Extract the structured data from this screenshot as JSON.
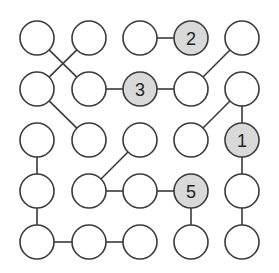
{
  "puzzle": {
    "type": "hashi-style node graph",
    "rows": 5,
    "cols": 5,
    "colors": {
      "background": "#ffffff",
      "node_fill": "#ffffff",
      "clue_fill": "#d9d9d9",
      "stroke": "#3a3a3a",
      "text": "#222222"
    },
    "col_x": [
      37,
      89,
      140,
      191,
      242
    ],
    "row_y": [
      38,
      89,
      140,
      191,
      242
    ],
    "radius": 17,
    "nodes": [
      {
        "r": 0,
        "c": 0,
        "label": ""
      },
      {
        "r": 0,
        "c": 1,
        "label": ""
      },
      {
        "r": 0,
        "c": 2,
        "label": ""
      },
      {
        "r": 0,
        "c": 3,
        "label": "2"
      },
      {
        "r": 0,
        "c": 4,
        "label": ""
      },
      {
        "r": 1,
        "c": 0,
        "label": ""
      },
      {
        "r": 1,
        "c": 1,
        "label": ""
      },
      {
        "r": 1,
        "c": 2,
        "label": "3"
      },
      {
        "r": 1,
        "c": 3,
        "label": ""
      },
      {
        "r": 1,
        "c": 4,
        "label": ""
      },
      {
        "r": 2,
        "c": 0,
        "label": ""
      },
      {
        "r": 2,
        "c": 1,
        "label": ""
      },
      {
        "r": 2,
        "c": 2,
        "label": ""
      },
      {
        "r": 2,
        "c": 3,
        "label": ""
      },
      {
        "r": 2,
        "c": 4,
        "label": "1"
      },
      {
        "r": 3,
        "c": 0,
        "label": ""
      },
      {
        "r": 3,
        "c": 1,
        "label": ""
      },
      {
        "r": 3,
        "c": 2,
        "label": ""
      },
      {
        "r": 3,
        "c": 3,
        "label": "5"
      },
      {
        "r": 3,
        "c": 4,
        "label": ""
      },
      {
        "r": 4,
        "c": 0,
        "label": ""
      },
      {
        "r": 4,
        "c": 1,
        "label": ""
      },
      {
        "r": 4,
        "c": 2,
        "label": ""
      },
      {
        "r": 4,
        "c": 3,
        "label": ""
      },
      {
        "r": 4,
        "c": 4,
        "label": ""
      }
    ],
    "edges": [
      [
        [
          0,
          1
        ],
        [
          1,
          0
        ]
      ],
      [
        [
          0,
          0
        ],
        [
          1,
          1
        ]
      ],
      [
        [
          0,
          2
        ],
        [
          0,
          3
        ]
      ],
      [
        [
          1,
          1
        ],
        [
          1,
          2
        ]
      ],
      [
        [
          1,
          2
        ],
        [
          1,
          3
        ]
      ],
      [
        [
          1,
          3
        ],
        [
          0,
          4
        ]
      ],
      [
        [
          1,
          0
        ],
        [
          2,
          1
        ]
      ],
      [
        [
          1,
          4
        ],
        [
          2,
          3
        ]
      ],
      [
        [
          1,
          4
        ],
        [
          2,
          4
        ]
      ],
      [
        [
          2,
          2
        ],
        [
          3,
          1
        ]
      ],
      [
        [
          2,
          0
        ],
        [
          3,
          0
        ]
      ],
      [
        [
          3,
          0
        ],
        [
          4,
          0
        ]
      ],
      [
        [
          3,
          1
        ],
        [
          3,
          2
        ]
      ],
      [
        [
          3,
          2
        ],
        [
          3,
          3
        ]
      ],
      [
        [
          2,
          4
        ],
        [
          3,
          4
        ]
      ],
      [
        [
          3,
          3
        ],
        [
          4,
          3
        ]
      ],
      [
        [
          3,
          4
        ],
        [
          4,
          4
        ]
      ],
      [
        [
          4,
          0
        ],
        [
          4,
          1
        ]
      ],
      [
        [
          4,
          1
        ],
        [
          4,
          2
        ]
      ]
    ]
  }
}
